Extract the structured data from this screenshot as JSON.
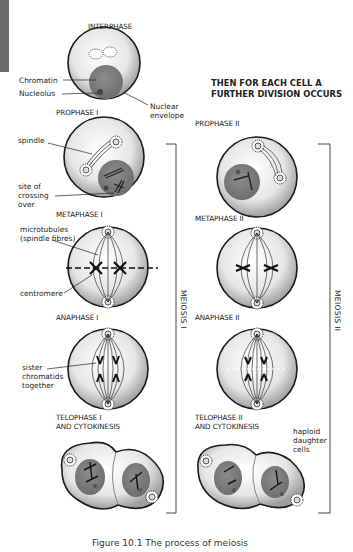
{
  "left_column": {
    "stages": [
      {
        "id": "interphase",
        "title": "INTERPHASE"
      },
      {
        "id": "prophase-1",
        "title": "PROPHASE I"
      },
      {
        "id": "metaphase-1",
        "title": "METAPHASE I"
      },
      {
        "id": "anaphase-1",
        "title": "ANAPHASE I"
      },
      {
        "id": "telophase-1",
        "title_line1": "TELOPHASE I",
        "title_line2": "AND CYTOKINESIS"
      }
    ],
    "labels": {
      "chromatin": "Chromatin",
      "nucleolus": "Nucleolus",
      "nuclear_envelope_line1": "Nuclear",
      "nuclear_envelope_line2": "envelope",
      "spindle": "spindle",
      "crossing_line1": "site of",
      "crossing_line2": "crossing",
      "crossing_line3": "over",
      "microtubules_line1": "microtubules",
      "microtubules_line2": "(spindle fibres)",
      "centromere": "centromere",
      "sister_line1": "sister",
      "sister_line2": "chromatids",
      "sister_line3": "together"
    },
    "bracket_label": "MEIOSIS I"
  },
  "right_column": {
    "header_line1": "THEN FOR EACH CELL A",
    "header_line2": "FURTHER DIVISION OCCURS",
    "stages": [
      {
        "id": "prophase-2",
        "title": "PROPHASE II"
      },
      {
        "id": "metaphase-2",
        "title": "METAPHASE II"
      },
      {
        "id": "anaphase-2",
        "title": "ANAPHASE II"
      },
      {
        "id": "telophase-2",
        "title_line1": "TELOPHASE II",
        "title_line2": "AND CYTOKINESIS"
      }
    ],
    "labels": {
      "haploid_line1": "haploid",
      "haploid_line2": "daughter",
      "haploid_line3": "cells"
    },
    "bracket_label": "MEIOSIS II"
  },
  "caption": "Figure 10.1   The process of meiosis",
  "colors": {
    "cell_fill_center": "#ffffff",
    "cell_fill_edge": "#a8a8a8",
    "nucleus": "#808080",
    "outline": "#1a1a1a",
    "side_tab": "#6b6b6b"
  }
}
